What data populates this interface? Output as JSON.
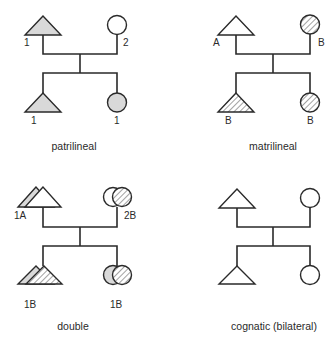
{
  "colors": {
    "line": "#2a2a2a",
    "patrilineal_fill": "#d9d9d9",
    "hatch": "#8a8a8a",
    "white": "#ffffff"
  },
  "panels": [
    {
      "id": "patrilineal",
      "caption": "patrilineal",
      "father_label": "1",
      "mother_label": "2",
      "son_label": "1",
      "daughter_label": "1"
    },
    {
      "id": "matrilineal",
      "caption": "matrilineal",
      "father_label": "A",
      "mother_label": "B",
      "son_label": "B",
      "daughter_label": "B"
    },
    {
      "id": "double",
      "caption": "double",
      "father_label": "1A",
      "mother_label": "2B",
      "son_label": "1B",
      "daughter_label": "1B"
    },
    {
      "id": "cognatic",
      "caption": "cognatic (bilateral)",
      "father_label": "",
      "mother_label": "",
      "son_label": "",
      "daughter_label": ""
    }
  ],
  "legend": {
    "male_symbol": "triangle",
    "female_symbol": "circle",
    "patriline_pattern": "gray-fill",
    "matriline_pattern": "diagonal-hatch"
  }
}
